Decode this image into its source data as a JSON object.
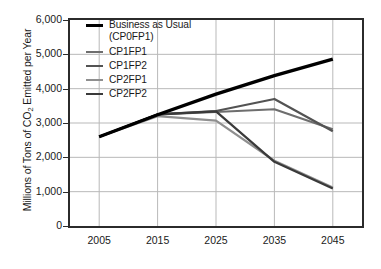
{
  "chart_data": {
    "type": "line",
    "title": "",
    "xlabel": "",
    "ylabel": "Millions of Tons of CO2 Emitted per Year",
    "ylabel_parts": {
      "pre": "Millions of Tons of CO",
      "sub": "2",
      "post": " Emitted per Year"
    },
    "x": [
      2005,
      2015,
      2025,
      2035,
      2045
    ],
    "xtick_labels": [
      "2005",
      "2015",
      "2025",
      "2035",
      "2045"
    ],
    "ytick_labels": [
      "0",
      "1,000",
      "2,000",
      "3,000",
      "4,000",
      "5,000",
      "6,000"
    ],
    "ytick_values": [
      0,
      1000,
      2000,
      3000,
      4000,
      5000,
      6000
    ],
    "xlim": [
      2000,
      2050
    ],
    "ylim": [
      0,
      6000
    ],
    "grid": true,
    "legend_position": "top-left-inside",
    "series": [
      {
        "name": "Business as Usual\n(CP0FP1)",
        "legend_label": "Business as Usual\n(CP0FP1)",
        "short_name": "CP0FP1",
        "color": "#000000",
        "width": 3.4,
        "values": [
          2600,
          3240,
          3840,
          4380,
          4860
        ]
      },
      {
        "name": "CP1FP1",
        "legend_label": "CP1FP1",
        "short_name": "CP1FP1",
        "color": "#6e6e6e",
        "width": 2.2,
        "values": [
          2600,
          3250,
          3320,
          3400,
          2820
        ]
      },
      {
        "name": "CP1FP2",
        "legend_label": "CP1FP2",
        "short_name": "CP1FP2",
        "color": "#535353",
        "width": 2.2,
        "values": [
          2600,
          3250,
          3350,
          3700,
          2760
        ]
      },
      {
        "name": "CP2FP1",
        "legend_label": "CP2FP1",
        "short_name": "CP2FP1",
        "color": "#8f8f8f",
        "width": 2.2,
        "values": [
          2600,
          3200,
          3070,
          1900,
          1120
        ]
      },
      {
        "name": "CP2FP2",
        "legend_label": "CP2FP2",
        "short_name": "CP2FP2",
        "color": "#3a3a3a",
        "width": 2.2,
        "values": [
          2600,
          3250,
          3340,
          1870,
          1090
        ]
      }
    ]
  }
}
